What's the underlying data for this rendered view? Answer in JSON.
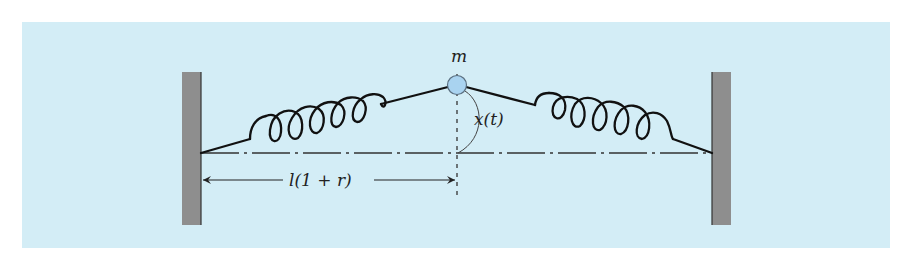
{
  "figure": {
    "colors": {
      "page_background": "#ffffff",
      "panel_background": "#d3edf6",
      "wall_fill": "#8e8e8e",
      "wall_edge": "#333333",
      "spring_stroke": "#111111",
      "mass_fill": "#a9d3f0",
      "mass_stroke": "#5a6f80",
      "centerline": "#333333",
      "annotation": "#333333"
    },
    "labels": {
      "mass": "m",
      "displacement": "x(t)",
      "half_length": "l(1 + r)"
    },
    "elements": {
      "left_wall": "Left fixed wall",
      "right_wall": "Right fixed wall",
      "left_spring": "Left spring (7 coils)",
      "right_spring": "Right spring (7 coils)",
      "mass": "Point mass",
      "centerline": "Equilibrium center line (dash-dot)",
      "vertical_axis": "Vertical dashed axis through mass",
      "dimension_arrow": "Dimension arrow from left wall to center"
    }
  }
}
